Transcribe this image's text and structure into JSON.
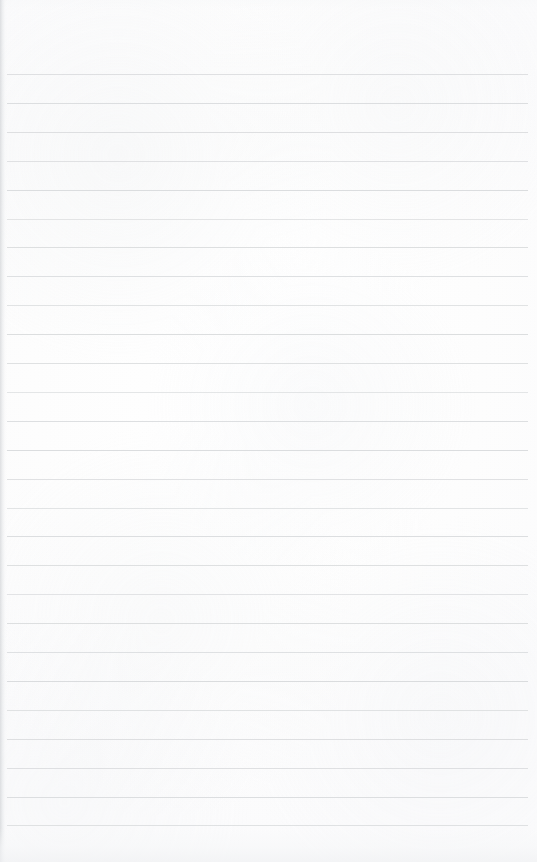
{
  "document": {
    "type": "blank-ruled-notebook-page",
    "title": "Blank lined paper",
    "page_width": 537,
    "page_height": 862,
    "has_text_content": false,
    "visible_text": "",
    "paper_color": "#fdfdfd",
    "rule_color": "#d9dbdd",
    "edge_shadow_color": "#c4c7cb"
  },
  "ruling": {
    "line_count": 27,
    "first_line_y": 74,
    "last_line_y": 826,
    "line_spacing": 28.9,
    "line_thickness": 1,
    "line_start_x": 7,
    "line_end_x": 528,
    "top_margin": 74,
    "bottom_margin": 36,
    "left_margin": 7,
    "right_margin": 9,
    "has_vertical_margin_rule": false,
    "line_opacities": [
      0.85,
      0.92,
      0.88,
      0.8,
      0.95,
      0.72,
      0.9,
      0.86,
      0.78,
      0.93,
      0.84,
      0.7,
      0.89,
      0.94,
      0.82,
      0.76,
      0.91,
      0.87,
      0.74,
      0.9,
      0.83,
      0.96,
      0.79,
      0.88,
      0.85,
      0.92,
      0.81
    ]
  }
}
